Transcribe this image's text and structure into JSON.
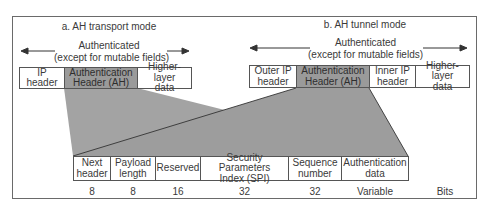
{
  "transport": {
    "title": "a. AH transport mode",
    "auth_label_1": "Authenticated",
    "auth_label_2": "(except for mutable fields)",
    "packet": [
      {
        "label": "IP\nheader",
        "shaded": false
      },
      {
        "label": "Authentication\nHeader (AH)",
        "shaded": true
      },
      {
        "label": "Higher-layer\ndata",
        "shaded": false
      }
    ]
  },
  "tunnel": {
    "title": "b. AH tunnel mode",
    "auth_label_1": "Authenticated",
    "auth_label_2": "(except for mutable fields)",
    "packet": [
      {
        "label": "Outer IP\nheader",
        "shaded": false
      },
      {
        "label": "Authentication\nHeader (AH)",
        "shaded": true
      },
      {
        "label": "Inner IP\nheader",
        "shaded": false
      },
      {
        "label": "Higher-layer\ndata",
        "shaded": false
      }
    ]
  },
  "ah_fields": [
    {
      "label": "Next\nheader",
      "bits": "8"
    },
    {
      "label": "Payload\nlength",
      "bits": "8"
    },
    {
      "label": "Reserved",
      "bits": "16"
    },
    {
      "label": "Security Parameters\nIndex (SPI)",
      "bits": "32"
    },
    {
      "label": "Sequence\nnumber",
      "bits": "32"
    },
    {
      "label": "Authentication\ndata",
      "bits": "Variable"
    }
  ],
  "bits_unit": "Bits",
  "colors": {
    "shade": "#9a9a9a",
    "border": "#555555",
    "text": "#3a3a3a"
  }
}
